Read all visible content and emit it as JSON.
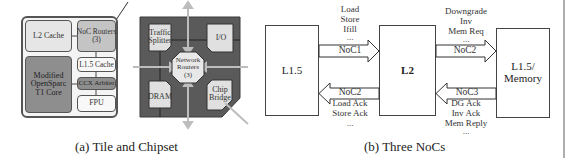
{
  "figure": {
    "subfigure_a": {
      "caption": "(a) Tile and Chipset",
      "tile": {
        "blocks": [
          {
            "id": "l2-cache",
            "label": "L2 Cache",
            "shade": "light"
          },
          {
            "id": "noc-routers",
            "label_line1": "NoC Routers",
            "label_line2": "(3)",
            "shade": "mid"
          },
          {
            "id": "core",
            "label_line1": "Modified",
            "label_line2": "OpenSparc",
            "label_line3": "T1 Core",
            "shade": "dark"
          },
          {
            "id": "l15-cache",
            "label": "L1.5 Cache",
            "shade": "white"
          },
          {
            "id": "ccx-arbiter",
            "label": "CCX Arbiter",
            "shade": "dark"
          },
          {
            "id": "fpu",
            "label": "FPU",
            "shade": "white"
          }
        ]
      },
      "chipset": {
        "blocks": [
          {
            "id": "traffic-splitter",
            "label_line1": "Traffic",
            "label_line2": "Splitter"
          },
          {
            "id": "io",
            "label": "I/O"
          },
          {
            "id": "network-routers",
            "label_line1": "Network",
            "label_line2": "Routers",
            "label_line3": "(3)"
          },
          {
            "id": "dram",
            "label": "DRAM"
          },
          {
            "id": "chip-bridge",
            "label_line1": "Chip",
            "label_line2": "Bridge"
          }
        ]
      }
    },
    "subfigure_b": {
      "caption": "(b) Three NoCs",
      "boxes": {
        "left": "L1.5",
        "middle": "L2",
        "right_line1": "L1.5/",
        "right_line2": "Memory"
      },
      "arrows": {
        "noc1": {
          "label": "NoC1",
          "direction": "right",
          "messages": [
            "Load",
            "Store",
            "Ifill",
            "..."
          ]
        },
        "noc2_lower": {
          "label": "NoC2",
          "direction": "left",
          "messages": [
            "Load Ack",
            "Store Ack",
            "..."
          ]
        },
        "noc2_upper": {
          "label": "NoC2",
          "direction": "right",
          "messages": [
            "Downgrade",
            "Inv",
            "Mem Req",
            "..."
          ]
        },
        "noc3": {
          "label": "NoC3",
          "direction": "left",
          "messages": [
            "DG Ack",
            "Inv Ack",
            "Mem Reply",
            "..."
          ]
        }
      }
    }
  }
}
